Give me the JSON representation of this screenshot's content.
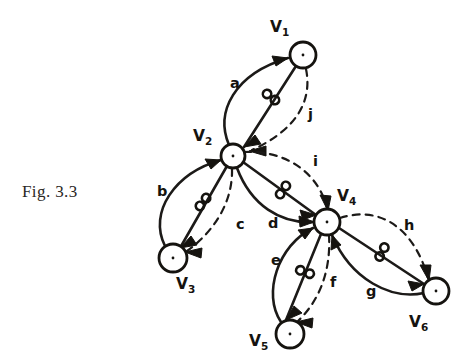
{
  "figure": {
    "caption": "Fig. 3.3",
    "type": "directed-graph-diagram"
  },
  "nodes": [
    {
      "id": "v1",
      "label": "V",
      "sub": "1",
      "cx": 303,
      "cy": 55,
      "r": 13,
      "label_x": 270,
      "label_y": 32
    },
    {
      "id": "v2",
      "label": "V",
      "sub": "2",
      "cx": 233,
      "cy": 156,
      "r": 12,
      "label_x": 193,
      "label_y": 141
    },
    {
      "id": "v3",
      "label": "V",
      "sub": "3",
      "cx": 173,
      "cy": 258,
      "r": 14,
      "label_x": 176,
      "label_y": 289
    },
    {
      "id": "v4",
      "label": "V",
      "sub": "4",
      "cx": 327,
      "cy": 222,
      "r": 13,
      "label_x": 337,
      "label_y": 201
    },
    {
      "id": "v5",
      "label": "V",
      "sub": "5",
      "cx": 290,
      "cy": 334,
      "r": 14,
      "label_x": 249,
      "label_y": 346
    },
    {
      "id": "v6",
      "label": "V",
      "sub": "6",
      "cx": 436,
      "cy": 291,
      "r": 13,
      "label_x": 409,
      "label_y": 327
    }
  ],
  "edges": [
    {
      "id": "a",
      "label": "a",
      "style": "solid",
      "from": "v2",
      "to": "v1",
      "label_x": 230,
      "label_y": 88,
      "knot": false
    },
    {
      "id": "a2",
      "label": "",
      "style": "solid",
      "from": "v1",
      "to": "v2",
      "label_x": 0,
      "label_y": 0,
      "knot": true
    },
    {
      "id": "b",
      "label": "b",
      "style": "solid",
      "from": "v3",
      "to": "v2",
      "label_x": 157,
      "label_y": 196,
      "knot": false
    },
    {
      "id": "b2",
      "label": "",
      "style": "solid",
      "from": "v2",
      "to": "v3",
      "label_x": 0,
      "label_y": 0,
      "knot": true
    },
    {
      "id": "c",
      "label": "c",
      "style": "dashed",
      "from": "v3",
      "to": "v2",
      "label_x": 236,
      "label_y": 229,
      "knot": false
    },
    {
      "id": "d",
      "label": "d",
      "style": "solid",
      "from": "v2",
      "to": "v4",
      "label_x": 268,
      "label_y": 228,
      "knot": false
    },
    {
      "id": "d2",
      "label": "",
      "style": "solid",
      "from": "v2",
      "to": "v4",
      "label_x": 0,
      "label_y": 0,
      "knot": true
    },
    {
      "id": "e",
      "label": "e",
      "style": "solid",
      "from": "v5",
      "to": "v4",
      "label_x": 271,
      "label_y": 265,
      "knot": false
    },
    {
      "id": "e2",
      "label": "",
      "style": "solid",
      "from": "v4",
      "to": "v5",
      "label_x": 0,
      "label_y": 0,
      "knot": true
    },
    {
      "id": "f",
      "label": "f",
      "style": "dashed",
      "from": "v5",
      "to": "v4",
      "label_x": 330,
      "label_y": 287,
      "knot": false
    },
    {
      "id": "g",
      "label": "g",
      "style": "solid",
      "from": "v6",
      "to": "v4",
      "label_x": 366,
      "label_y": 296,
      "knot": false
    },
    {
      "id": "g2",
      "label": "",
      "style": "solid",
      "from": "v4",
      "to": "v6",
      "label_x": 0,
      "label_y": 0,
      "knot": true
    },
    {
      "id": "h",
      "label": "h",
      "style": "dashed",
      "from": "v4",
      "to": "v6",
      "label_x": 404,
      "label_y": 230,
      "knot": false
    },
    {
      "id": "i",
      "label": "i",
      "style": "dashed",
      "from": "v2",
      "to": "v4",
      "label_x": 313,
      "label_y": 166,
      "knot": false
    },
    {
      "id": "j",
      "label": "j",
      "style": "dashed",
      "from": "v1",
      "to": "v2",
      "label_x": 308,
      "label_y": 119,
      "knot": false
    }
  ],
  "knots": [
    {
      "id": "knot-v1-v2",
      "cx": 271,
      "cy": 97,
      "angle": 38
    },
    {
      "id": "knot-v2-v3",
      "cx": 203,
      "cy": 202,
      "angle": 128
    },
    {
      "id": "knot-v2-v4",
      "cx": 283,
      "cy": 190,
      "angle": 35
    },
    {
      "id": "knot-v4-v5",
      "cx": 305,
      "cy": 272,
      "angle": 110
    },
    {
      "id": "knot-v4-v6",
      "cx": 382,
      "cy": 252,
      "angle": 28
    }
  ],
  "colors": {
    "ink": "#15130f",
    "background": "#ffffff",
    "caption": "#2a2724"
  }
}
